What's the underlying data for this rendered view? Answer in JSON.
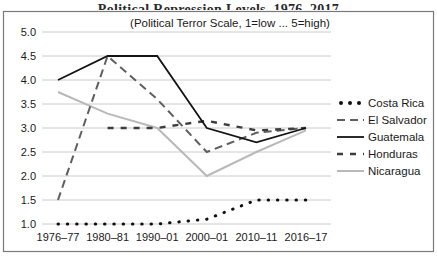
{
  "cropped_title": "Political Repression Levels, 1976–2017",
  "chart_data": {
    "type": "line",
    "subtitle": "(Political Terror Scale, 1=low ... 5=high)",
    "categories": [
      "1976–77",
      "1980–81",
      "1990–01",
      "2000–01",
      "2010–11",
      "2016–17"
    ],
    "yticks": [
      "5.0",
      "4.5",
      "4.0",
      "3.5",
      "3.0",
      "2.5",
      "2.0",
      "1.5",
      "1.0"
    ],
    "ylim": [
      1.0,
      5.0
    ],
    "grid": "horizontal",
    "legend_position": "right",
    "frame_color": "#7a7a7a",
    "gridline_color": "#cccccc",
    "series": [
      {
        "name": "Costa Rica",
        "values": [
          1.0,
          1.0,
          1.0,
          1.1,
          1.5,
          1.5
        ],
        "style": {
          "type": "dotted",
          "color": "#111111",
          "width": 3
        }
      },
      {
        "name": "El Salvador",
        "values": [
          1.5,
          4.5,
          3.6,
          2.5,
          2.9,
          3.0
        ],
        "style": {
          "type": "dashed",
          "color": "#5f5f5f",
          "dash": "8 5",
          "width": 2
        }
      },
      {
        "name": "Guatemala",
        "values": [
          4.0,
          4.5,
          4.5,
          3.0,
          2.7,
          3.0
        ],
        "style": {
          "type": "solid",
          "color": "#141414",
          "width": 1.8
        }
      },
      {
        "name": "Honduras",
        "values": [
          null,
          3.0,
          3.0,
          3.15,
          2.95,
          3.0
        ],
        "style": {
          "type": "dashed",
          "color": "#3d3d3d",
          "dash": "6 7",
          "width": 2.4
        }
      },
      {
        "name": "Nicaragua",
        "values": [
          3.75,
          3.3,
          3.0,
          2.0,
          2.5,
          2.95
        ],
        "style": {
          "type": "solid",
          "color": "#b9b9b9",
          "width": 2
        }
      }
    ]
  }
}
